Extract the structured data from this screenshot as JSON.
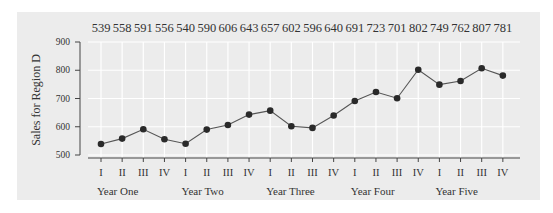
{
  "chart_data": {
    "type": "line",
    "title": "",
    "xlabel": "",
    "ylabel": "Sales for Region D",
    "ylim": [
      500,
      900
    ],
    "yticks": [
      500,
      600,
      700,
      800,
      900
    ],
    "grid": true,
    "legend": null,
    "categories": [
      "I",
      "II",
      "III",
      "IV",
      "I",
      "II",
      "III",
      "IV",
      "I",
      "II",
      "III",
      "IV",
      "I",
      "II",
      "III",
      "IV",
      "I",
      "II",
      "III",
      "IV"
    ],
    "groups": [
      "Year One",
      "Year Two",
      "Year Three",
      "Year Four",
      "Year Five"
    ],
    "series": [
      {
        "name": "Sales for Region D",
        "values": [
          539,
          558,
          591,
          556,
          540,
          590,
          606,
          643,
          657,
          602,
          596,
          640,
          691,
          723,
          701,
          802,
          749,
          762,
          807,
          781
        ]
      }
    ],
    "data_labels_position": "top"
  },
  "colors": {
    "panel": "#ececec",
    "grid": "#ffffff",
    "line": "#555555",
    "marker": "#2a2a2a",
    "axis": "#444444",
    "text": "#333333"
  }
}
